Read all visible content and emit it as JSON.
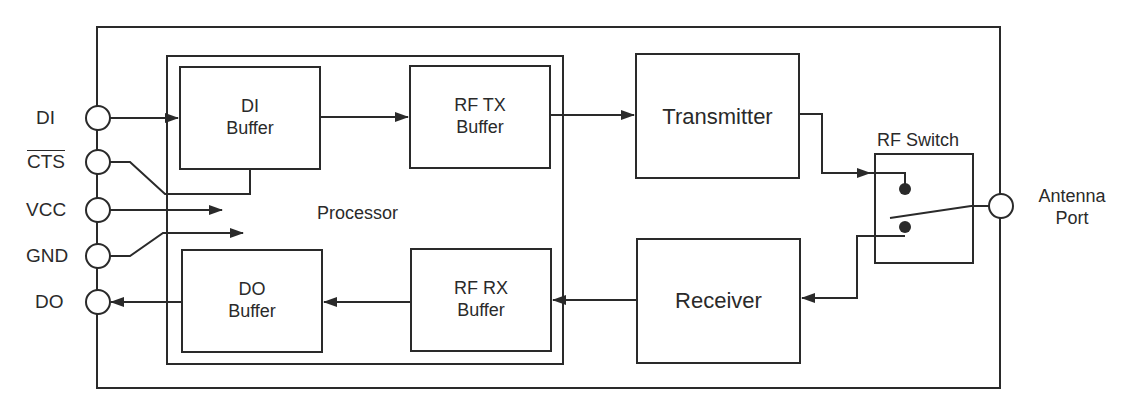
{
  "diagram": {
    "pins": [
      {
        "label": "DI",
        "overline": false
      },
      {
        "label": "CTS",
        "overline": true
      },
      {
        "label": "VCC",
        "overline": false
      },
      {
        "label": "GND",
        "overline": false
      },
      {
        "label": "DO",
        "overline": false
      }
    ],
    "processor": {
      "label": "Processor"
    },
    "blocks": {
      "di_buffer": {
        "line1": "DI",
        "line2": "Buffer"
      },
      "rf_tx_buffer": {
        "line1": "RF TX",
        "line2": "Buffer"
      },
      "do_buffer": {
        "line1": "DO",
        "line2": "Buffer"
      },
      "rf_rx_buffer": {
        "line1": "RF RX",
        "line2": "Buffer"
      },
      "transmitter": {
        "label": "Transmitter"
      },
      "receiver": {
        "label": "Receiver"
      },
      "rf_switch": {
        "label": "RF Switch"
      }
    },
    "antenna": {
      "line1": "Antenna",
      "line2": "Port"
    },
    "connections": [
      {
        "from": "DI",
        "to": "DI Buffer"
      },
      {
        "from": "CTS",
        "to": "DI Buffer"
      },
      {
        "from": "VCC",
        "to": "Processor"
      },
      {
        "from": "GND",
        "to": "Processor"
      },
      {
        "from": "DI Buffer",
        "to": "RF TX Buffer"
      },
      {
        "from": "RF TX Buffer",
        "to": "Transmitter"
      },
      {
        "from": "Transmitter",
        "to": "RF Switch"
      },
      {
        "from": "RF Switch",
        "to": "Antenna Port"
      },
      {
        "from": "RF Switch",
        "to": "Receiver"
      },
      {
        "from": "Receiver",
        "to": "RF RX Buffer"
      },
      {
        "from": "RF RX Buffer",
        "to": "DO Buffer"
      },
      {
        "from": "DO Buffer",
        "to": "DO"
      }
    ],
    "colors": {
      "line": "#2a2a2a",
      "background": "#ffffff"
    }
  }
}
